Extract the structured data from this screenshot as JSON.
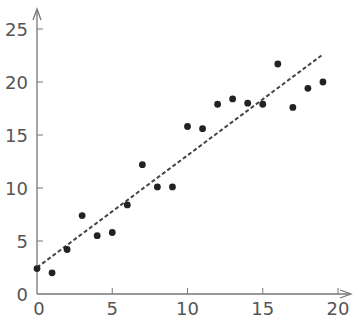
{
  "chart_data": {
    "type": "scatter",
    "title": "",
    "xlabel": "",
    "ylabel": "",
    "xlim": [
      0,
      20
    ],
    "ylim": [
      0,
      26
    ],
    "grid": false,
    "legend": null,
    "x_ticks": [
      0,
      5,
      10,
      15,
      20
    ],
    "y_ticks": [
      0,
      5,
      10,
      15,
      20,
      25
    ],
    "x_tick_labels": [
      "0",
      "5",
      "10",
      "15",
      "20"
    ],
    "y_tick_labels": [
      "0",
      "5",
      "10",
      "15",
      "20",
      "25"
    ],
    "series": [
      {
        "name": "observations",
        "style": "markers",
        "color": "#222222",
        "x": [
          0,
          1,
          2,
          3,
          4,
          5,
          6,
          7,
          8,
          9,
          10,
          11,
          12,
          13,
          14,
          15,
          16,
          17,
          18,
          19
        ],
        "y": [
          2.4,
          2.0,
          4.2,
          7.4,
          5.5,
          5.8,
          8.4,
          12.2,
          10.1,
          10.1,
          15.8,
          15.6,
          17.9,
          18.4,
          18.0,
          17.9,
          21.7,
          17.6,
          19.4,
          20.0
        ]
      },
      {
        "name": "trend line",
        "style": "dashed-line",
        "color": "#444444",
        "x": [
          0,
          18.9
        ],
        "y": [
          2.5,
          22.5
        ]
      }
    ],
    "axes": {
      "color": "#777777",
      "arrows": true
    }
  }
}
